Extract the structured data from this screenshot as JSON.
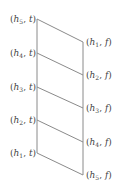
{
  "diagram": {
    "line_color": "#8a8a8a",
    "left_nodes": [
      {
        "var": "h",
        "sub": "5",
        "val": "t",
        "y": 19
      },
      {
        "var": "h",
        "sub": "4",
        "val": "t",
        "y": 53
      },
      {
        "var": "h",
        "sub": "3",
        "val": "t",
        "y": 87
      },
      {
        "var": "h",
        "sub": "2",
        "val": "t",
        "y": 120
      },
      {
        "var": "h",
        "sub": "1",
        "val": "t",
        "y": 153
      }
    ],
    "right_nodes": [
      {
        "var": "h",
        "sub": "1",
        "val": "f",
        "y": 42
      },
      {
        "var": "h",
        "sub": "2",
        "val": "f",
        "y": 75
      },
      {
        "var": "h",
        "sub": "3",
        "val": "f",
        "y": 108
      },
      {
        "var": "h",
        "sub": "4",
        "val": "f",
        "y": 142
      },
      {
        "var": "h",
        "sub": "5",
        "val": "f",
        "y": 175
      }
    ]
  }
}
